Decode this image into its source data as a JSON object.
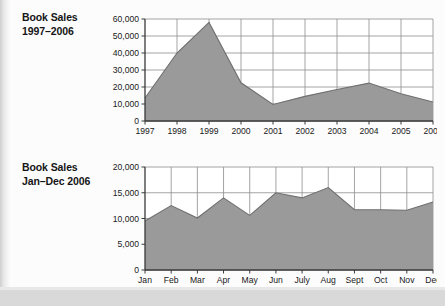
{
  "page": {
    "background_color": "#fbfbfb",
    "paper_color": "#fcfcfc",
    "area_fill_color": "#9a9a9a",
    "gridline_color": "#8d8d8d",
    "axis_color": "#3a3a3a"
  },
  "charts": [
    {
      "title_line1": "Book Sales",
      "title_line2": "1997–2006"
    },
    {
      "title_line1": "Book Sales",
      "title_line2": "Jan–Dec 2006"
    }
  ],
  "chart_data": [
    {
      "type": "area",
      "title": "Book Sales 1997–2006",
      "xlabel": "",
      "ylabel": "",
      "categories": [
        "1997",
        "1998",
        "1999",
        "2000",
        "2001",
        "2002",
        "2003",
        "2004",
        "2005",
        "2006"
      ],
      "values": [
        13500,
        40000,
        58000,
        22500,
        9700,
        14500,
        18500,
        22300,
        16000,
        11200
      ],
      "ylim": [
        0,
        60000
      ],
      "yticks": [
        0,
        10000,
        20000,
        30000,
        40000,
        50000,
        60000
      ],
      "ytick_labels": [
        "0",
        "10,000",
        "20,000",
        "30,000",
        "40,000",
        "50,000",
        "60,000"
      ],
      "grid": true,
      "legend": "none"
    },
    {
      "type": "area",
      "title": "Book Sales Jan–Dec 2006",
      "xlabel": "",
      "ylabel": "",
      "categories": [
        "Jan",
        "Feb",
        "Mar",
        "Apr",
        "May",
        "Jun",
        "July",
        "Aug",
        "Sept",
        "Oct",
        "Nov",
        "Dec"
      ],
      "values": [
        9500,
        12500,
        10100,
        14000,
        10600,
        15000,
        14000,
        16000,
        11700,
        11700,
        11600,
        13200
      ],
      "ylim": [
        0,
        20000
      ],
      "yticks": [
        0,
        5000,
        10000,
        15000,
        20000
      ],
      "ytick_labels": [
        "0",
        "5,000",
        "10,000",
        "15,000",
        "20,000"
      ],
      "grid": true,
      "legend": "none"
    }
  ]
}
